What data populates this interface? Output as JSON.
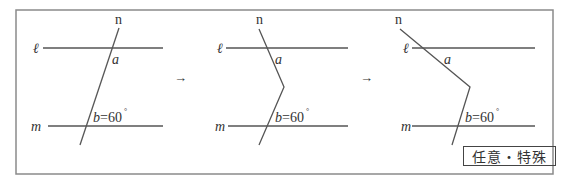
{
  "panels": [
    {
      "n": "n",
      "l": "ℓ",
      "m": "m",
      "a": "a",
      "b": "b=60",
      "deg": "°"
    },
    {
      "n": "n",
      "l": "ℓ",
      "m": "m",
      "a": "a",
      "b": "b=60",
      "deg": "°"
    },
    {
      "n": "n",
      "l": "ℓ",
      "m": "m",
      "a": "a",
      "b": "b=60",
      "deg": "°"
    }
  ],
  "arrows": [
    "→",
    "→"
  ],
  "tag": "任意・特殊",
  "colors": {
    "line": "#444444",
    "frame": "#888888",
    "text": "#333333"
  }
}
